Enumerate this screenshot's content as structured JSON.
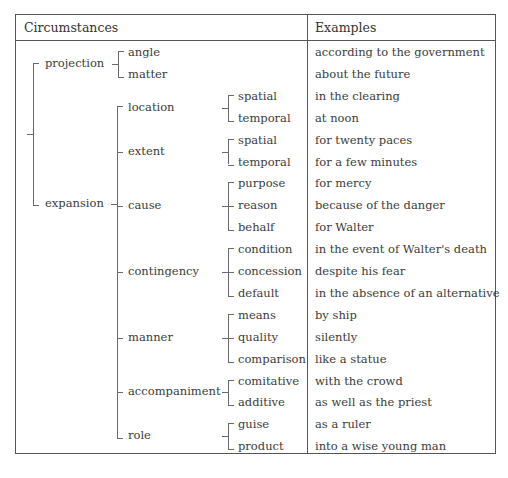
{
  "header": {
    "col1": "Circumstances",
    "col2": "Examples"
  },
  "tree": {
    "projection": {
      "label": "projection",
      "children": [
        "angle",
        "matter"
      ]
    },
    "expansion": {
      "label": "expansion",
      "children": [
        {
          "label": "location",
          "children": [
            "spatial",
            "temporal"
          ]
        },
        {
          "label": "extent",
          "children": [
            "spatial",
            "temporal"
          ]
        },
        {
          "label": "cause",
          "children": [
            "purpose",
            "reason",
            "behalf"
          ]
        },
        {
          "label": "contingency",
          "children": [
            "condition",
            "concession",
            "default"
          ]
        },
        {
          "label": "manner",
          "children": [
            "means",
            "quality",
            "comparison"
          ]
        },
        {
          "label": "accompaniment",
          "children": [
            "comitative",
            "additive"
          ]
        },
        {
          "label": "role",
          "children": [
            "guise",
            "product"
          ]
        }
      ]
    }
  },
  "rows": [
    {
      "leaf": "angle",
      "example": "according to the government"
    },
    {
      "leaf": "matter",
      "example": "about the future"
    },
    {
      "leaf": "spatial",
      "example": "in the clearing"
    },
    {
      "leaf": "temporal",
      "example": "at noon"
    },
    {
      "leaf": "spatial",
      "example": "for twenty paces"
    },
    {
      "leaf": "temporal",
      "example": "for a few minutes"
    },
    {
      "leaf": "purpose",
      "example": "for mercy"
    },
    {
      "leaf": "reason",
      "example": "because of the danger"
    },
    {
      "leaf": "behalf",
      "example": "for Walter"
    },
    {
      "leaf": "condition",
      "example": "in the event of Walter's death"
    },
    {
      "leaf": "concession",
      "example": "despite his fear"
    },
    {
      "leaf": "default",
      "example": "in the absence of an alternative"
    },
    {
      "leaf": "means",
      "example": "by ship"
    },
    {
      "leaf": "quality",
      "example": "silently"
    },
    {
      "leaf": "comparison",
      "example": "like a statue"
    },
    {
      "leaf": "comitative",
      "example": "with the crowd"
    },
    {
      "leaf": "additive",
      "example": "as well as the priest"
    },
    {
      "leaf": "guise",
      "example": "as a ruler"
    },
    {
      "leaf": "product",
      "example": "into a wise young man"
    }
  ]
}
